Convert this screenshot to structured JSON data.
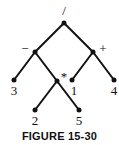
{
  "diagram": {
    "type": "expression-tree",
    "nodes": [
      {
        "id": "root",
        "label": "/",
        "x": 64,
        "y": 23,
        "label_x": 64,
        "label_y": 15
      },
      {
        "id": "minus",
        "label": "−",
        "x": 35,
        "y": 52,
        "label_x": 25,
        "label_y": 53
      },
      {
        "id": "plus",
        "label": "+",
        "x": 93,
        "y": 52,
        "label_x": 103,
        "label_y": 53
      },
      {
        "id": "leaf3",
        "label": "3",
        "x": 14,
        "y": 80,
        "label_x": 14,
        "label_y": 95
      },
      {
        "id": "times",
        "label": "*",
        "x": 57,
        "y": 81,
        "label_x": 64,
        "label_y": 81
      },
      {
        "id": "leaf1",
        "label": "1",
        "x": 72,
        "y": 80,
        "label_x": 74,
        "label_y": 95
      },
      {
        "id": "leaf4",
        "label": "4",
        "x": 114,
        "y": 80,
        "label_x": 114,
        "label_y": 95
      },
      {
        "id": "leaf2",
        "label": "2",
        "x": 35,
        "y": 110,
        "label_x": 35,
        "label_y": 125
      },
      {
        "id": "leaf5",
        "label": "5",
        "x": 79,
        "y": 110,
        "label_x": 79,
        "label_y": 125
      }
    ],
    "edges": [
      [
        "root",
        "minus"
      ],
      [
        "root",
        "plus"
      ],
      [
        "minus",
        "leaf3"
      ],
      [
        "minus",
        "times"
      ],
      [
        "plus",
        "leaf1"
      ],
      [
        "plus",
        "leaf4"
      ],
      [
        "times",
        "leaf2"
      ],
      [
        "times",
        "leaf5"
      ]
    ]
  },
  "caption": "FIGURE 15-30"
}
